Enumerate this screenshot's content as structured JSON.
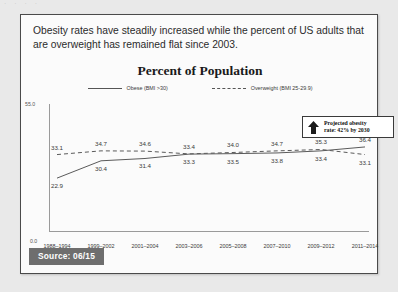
{
  "top_sliver_text": "· ·                                        · ·",
  "card": {
    "headline": "Obesity rates have steadily increased while the percent of US adults that are overweight has remained flat since 2003."
  },
  "source": {
    "label": "Source: 06/15"
  },
  "annotation": {
    "icon": "up-arrow-icon",
    "line1": "Projected obesity",
    "line2": "rate: 42% by 2030"
  },
  "chart_data": {
    "type": "line",
    "title": "Percent of Population",
    "xlabel": "",
    "ylabel": "",
    "ylim": [
      0.0,
      55.0
    ],
    "ytick_labels": [
      "55.0",
      "0.0"
    ],
    "grid": false,
    "legend_position": "top-center",
    "categories": [
      "1988–1994",
      "1999–2002",
      "2001–2004",
      "2003–2006",
      "2005–2008",
      "2007–2010",
      "2009–2012",
      "2011–2014"
    ],
    "series": [
      {
        "name": "Obese (BMI >30)",
        "style": "solid",
        "values": [
          22.9,
          30.4,
          31.4,
          33.3,
          33.5,
          33.8,
          34.7,
          36.4
        ]
      },
      {
        "name": "Overweight (BMI 25-29.9)",
        "style": "dashed",
        "values": [
          33.1,
          34.7,
          34.6,
          33.4,
          34.0,
          34.7,
          35.3,
          33.1
        ]
      }
    ],
    "labels_above": [
      "33.1",
      "34.7",
      "34.6",
      "33.4",
      "34.0",
      "34.7",
      "35.3",
      "36.4"
    ],
    "labels_below": [
      "22.9",
      "30.4",
      "31.4",
      "33.3",
      "33.5",
      "33.8",
      "33.4",
      "33.1"
    ]
  }
}
